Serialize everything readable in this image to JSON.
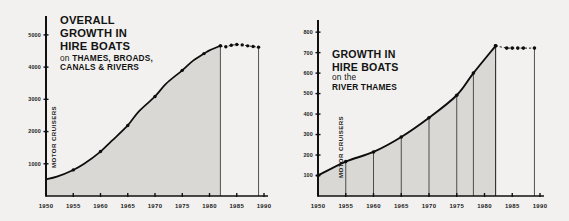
{
  "page": {
    "background_color": "#f2f1ef",
    "ink_color": "#101010",
    "area_fill_color": "#d9d8d5"
  },
  "charts": [
    {
      "id": "overall-growth-hire-boats",
      "title_lines": [
        "OVERALL",
        "GROWTH IN",
        "HIRE BOATS"
      ],
      "subtitle_lead": "on ",
      "subtitle_lines": [
        "THAMES, BROADS,",
        "CANALS & RIVERS"
      ],
      "ylabel": "MOTOR CRUISERS"
    },
    {
      "id": "growth-hire-boats-river-thames",
      "title_lines": [
        "GROWTH IN",
        "HIRE BOATS"
      ],
      "subtitle_lead": "on the",
      "subtitle_lines": [
        "RIVER THAMES"
      ],
      "ylabel": "MOTOR CRUISERS"
    }
  ],
  "chart_data": [
    {
      "type": "area",
      "title": "OVERALL GROWTH IN HIRE BOATS on THAMES, BROADS, CANALS & RIVERS",
      "xlabel": "",
      "ylabel": "MOTOR CRUISERS",
      "xlim": [
        1950,
        1990
      ],
      "ylim": [
        0,
        5400
      ],
      "yticks": [
        1000,
        2000,
        3000,
        4000,
        5000
      ],
      "ytick_labels": [
        "1000",
        "2000",
        "3000",
        "4000",
        "5000"
      ],
      "xticks": [
        1950,
        1955,
        1960,
        1965,
        1970,
        1975,
        1980,
        1985,
        1990
      ],
      "xtick_labels": [
        "1950",
        "1955",
        "1960",
        "1965",
        "1970",
        "1975",
        "1980",
        "1985",
        "1990"
      ],
      "grid": false,
      "legend": "none",
      "series": [
        {
          "name": "Motor cruisers (solid, filled)",
          "style": "solid-line-filled-area",
          "x": [
            1950,
            1952,
            1955,
            1957,
            1960,
            1962,
            1965,
            1967,
            1970,
            1972,
            1975,
            1977,
            1979,
            1980,
            1982
          ],
          "values": [
            520,
            600,
            810,
            1000,
            1380,
            1700,
            2190,
            2620,
            3090,
            3480,
            3900,
            4200,
            4420,
            4520,
            4660
          ]
        },
        {
          "name": "Motor cruisers (dotted projection)",
          "style": "dotted-line-markers",
          "x": [
            1982,
            1983,
            1984,
            1985,
            1986,
            1987,
            1988,
            1989
          ],
          "values": [
            4660,
            4630,
            4680,
            4700,
            4690,
            4660,
            4640,
            4620
          ]
        }
      ],
      "marked_points_x": [
        1955,
        1960,
        1965,
        1970,
        1975,
        1979,
        1982
      ],
      "boundary_year": 1982
    },
    {
      "type": "area",
      "title": "GROWTH IN HIRE BOATS on the RIVER THAMES",
      "xlabel": "",
      "ylabel": "MOTOR CRUISERS",
      "xlim": [
        1950,
        1990
      ],
      "ylim": [
        0,
        830
      ],
      "yticks": [
        100,
        200,
        300,
        400,
        500,
        600,
        700,
        800
      ],
      "ytick_labels": [
        "100",
        "200",
        "300",
        "400",
        "500",
        "600",
        "700",
        "800"
      ],
      "xticks": [
        1950,
        1955,
        1960,
        1965,
        1970,
        1975,
        1980,
        1985,
        1990
      ],
      "xtick_labels": [
        "1950",
        "1955",
        "1960",
        "1965",
        "1970",
        "1975",
        "1980",
        "1985",
        "1990"
      ],
      "grid": false,
      "legend": "none",
      "series": [
        {
          "name": "Motor cruisers (solid, filled)",
          "style": "solid-line-filled-area",
          "x": [
            1950,
            1955,
            1960,
            1965,
            1970,
            1975,
            1978,
            1982
          ],
          "values": [
            100,
            168,
            215,
            288,
            382,
            492,
            600,
            733
          ]
        },
        {
          "name": "Motor cruisers (dotted projection)",
          "style": "dotted-line-markers",
          "x": [
            1982,
            1984,
            1985,
            1986,
            1987,
            1989
          ],
          "values": [
            733,
            722,
            722,
            722,
            722,
            722
          ]
        }
      ],
      "dropline_years": [
        1950,
        1955,
        1960,
        1965,
        1970,
        1975,
        1978,
        1982
      ],
      "marked_points_x": [
        1950,
        1955,
        1960,
        1965,
        1970,
        1975,
        1978,
        1982
      ],
      "boundary_year": 1982
    }
  ]
}
